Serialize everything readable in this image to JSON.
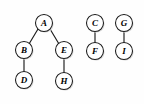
{
  "diagram": {
    "background_color": "#fefefe",
    "node_fill": "#ffffff",
    "node_stroke": "#1a1a1a",
    "edge_color": "#1c1c1c",
    "label_color": "#000000",
    "node_radius": 8.5,
    "nodes": [
      {
        "id": "A",
        "label": "A",
        "cx": 44,
        "cy": 23
      },
      {
        "id": "B",
        "label": "B",
        "cx": 24,
        "cy": 50
      },
      {
        "id": "E",
        "label": "E",
        "cx": 64,
        "cy": 50
      },
      {
        "id": "D",
        "label": "D",
        "cx": 24,
        "cy": 80
      },
      {
        "id": "H",
        "label": "H",
        "cx": 64,
        "cy": 81
      },
      {
        "id": "C",
        "label": "C",
        "cx": 95,
        "cy": 23
      },
      {
        "id": "F",
        "label": "F",
        "cx": 95,
        "cy": 51
      },
      {
        "id": "G",
        "label": "G",
        "cx": 124,
        "cy": 23
      },
      {
        "id": "I",
        "label": "I",
        "cx": 124,
        "cy": 51
      }
    ],
    "edges": [
      {
        "from": "A",
        "to": "B",
        "x1": 38,
        "y1": 29,
        "x2": 29,
        "y2": 44
      },
      {
        "from": "A",
        "to": "E",
        "x1": 50,
        "y1": 29,
        "x2": 59,
        "y2": 44
      },
      {
        "from": "B",
        "to": "D",
        "x1": 24,
        "y1": 59,
        "x2": 24,
        "y2": 71
      },
      {
        "from": "E",
        "to": "H",
        "x1": 64,
        "y1": 59,
        "x2": 64,
        "y2": 72
      },
      {
        "from": "C",
        "to": "F",
        "x1": 95,
        "y1": 32,
        "x2": 95,
        "y2": 42
      },
      {
        "from": "G",
        "to": "I",
        "x1": 124,
        "y1": 32,
        "x2": 124,
        "y2": 42
      }
    ],
    "components": [
      {
        "name": "tree-1",
        "root": "A",
        "members": [
          "A",
          "B",
          "E",
          "D",
          "H"
        ]
      },
      {
        "name": "tree-2",
        "root": "C",
        "members": [
          "C",
          "F"
        ]
      },
      {
        "name": "tree-3",
        "root": "G",
        "members": [
          "G",
          "I"
        ]
      }
    ]
  }
}
